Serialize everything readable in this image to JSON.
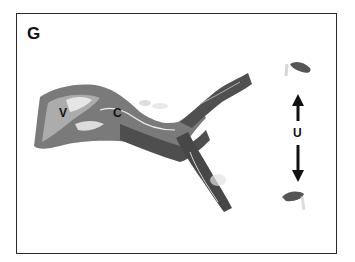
{
  "figure": {
    "panel_label": "G",
    "annotations": [
      {
        "id": "V",
        "text": "V",
        "x": 59,
        "y": 106
      },
      {
        "id": "C",
        "text": "C",
        "x": 113,
        "y": 106
      },
      {
        "id": "U",
        "text": "U",
        "x": 293,
        "y": 126
      }
    ],
    "arrows": [
      {
        "direction": "up",
        "x": 298,
        "y_from": 121,
        "y_to": 95
      },
      {
        "direction": "down",
        "x": 298,
        "y_from": 145,
        "y_to": 182
      }
    ],
    "colors": {
      "tissue_dark": "#4a4a4a",
      "tissue_mid": "#7a7a7a",
      "tissue_light": "#b8b8b8",
      "border": "#2a2a2a",
      "background": "#ffffff"
    }
  }
}
